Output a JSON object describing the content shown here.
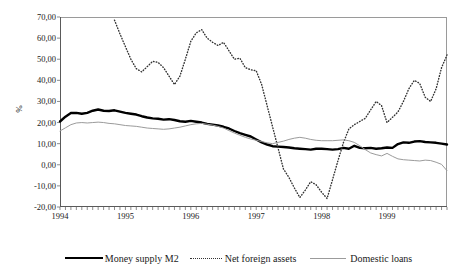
{
  "axis": {
    "ylabel": "%",
    "yticks": [
      "70,00",
      "60,00",
      "50,00",
      "40,00",
      "30,00",
      "20,00",
      "10,00",
      "0,00",
      "-10,00",
      "-20,00"
    ],
    "xticks": [
      "1994",
      "1995",
      "1996",
      "1997",
      "1998",
      "1999"
    ]
  },
  "legend": {
    "items": [
      {
        "label": "Money supply M2",
        "style": "solid-thick",
        "color": "#000000"
      },
      {
        "label": "Net foreign assets",
        "style": "dotted",
        "color": "#333333"
      },
      {
        "label": "Domestic loans",
        "style": "solid-thin",
        "color": "#9b9b9b"
      }
    ]
  },
  "chart_data": {
    "type": "line",
    "title": "",
    "xlabel": "",
    "ylabel": "%",
    "ylim": [
      -20,
      70
    ],
    "xlim": [
      "1994-01",
      "1999-12"
    ],
    "grid": false,
    "legend_position": "bottom",
    "x": [
      "1994-01",
      "1994-02",
      "1994-03",
      "1994-04",
      "1994-05",
      "1994-06",
      "1994-07",
      "1994-08",
      "1994-09",
      "1994-10",
      "1994-11",
      "1994-12",
      "1995-01",
      "1995-02",
      "1995-03",
      "1995-04",
      "1995-05",
      "1995-06",
      "1995-07",
      "1995-08",
      "1995-09",
      "1995-10",
      "1995-11",
      "1995-12",
      "1996-01",
      "1996-02",
      "1996-03",
      "1996-04",
      "1996-05",
      "1996-06",
      "1996-07",
      "1996-08",
      "1996-09",
      "1996-10",
      "1996-11",
      "1996-12",
      "1997-01",
      "1997-02",
      "1997-03",
      "1997-04",
      "1997-05",
      "1997-06",
      "1997-07",
      "1997-08",
      "1997-09",
      "1997-10",
      "1997-11",
      "1997-12",
      "1998-01",
      "1998-02",
      "1998-03",
      "1998-04",
      "1998-05",
      "1998-06",
      "1998-07",
      "1998-08",
      "1998-09",
      "1998-10",
      "1998-11",
      "1998-12",
      "1999-01",
      "1999-02",
      "1999-03",
      "1999-04",
      "1999-05",
      "1999-06",
      "1999-07",
      "1999-08",
      "1999-09",
      "1999-10",
      "1999-11",
      "1999-12"
    ],
    "series": [
      {
        "name": "Money supply M2",
        "style": "solid-thick",
        "color": "#000000",
        "values": [
          20.5,
          22.8,
          24.5,
          24.6,
          24.2,
          24.6,
          25.6,
          26.2,
          25.6,
          25.5,
          25.8,
          25.2,
          24.6,
          24.2,
          23.8,
          23.0,
          22.4,
          22.0,
          21.8,
          21.4,
          21.6,
          21.2,
          20.6,
          20.4,
          20.8,
          20.4,
          20.0,
          19.4,
          19.0,
          18.6,
          18.0,
          17.2,
          16.0,
          15.0,
          14.2,
          13.4,
          12.0,
          10.6,
          9.6,
          8.8,
          8.6,
          8.4,
          8.2,
          7.8,
          7.6,
          7.4,
          7.2,
          7.6,
          7.6,
          7.4,
          7.2,
          7.4,
          8.0,
          7.6,
          9.0,
          8.0,
          7.8,
          8.0,
          7.6,
          7.8,
          8.2,
          8.0,
          9.8,
          10.6,
          10.4,
          11.0,
          11.2,
          10.8,
          10.6,
          10.4,
          10.0,
          9.6
        ]
      },
      {
        "name": "Net foreign assets",
        "style": "dotted",
        "color": "#333333",
        "values": [
          null,
          null,
          null,
          null,
          null,
          null,
          null,
          null,
          null,
          null,
          68.5,
          62.0,
          56.0,
          50.0,
          45.5,
          44.0,
          46.5,
          49.0,
          48.5,
          46.0,
          42.0,
          38.0,
          42.0,
          50.0,
          58.5,
          62.5,
          64.0,
          60.0,
          58.0,
          56.5,
          58.0,
          54.0,
          50.0,
          50.5,
          46.0,
          45.0,
          44.5,
          38.0,
          28.0,
          18.0,
          8.0,
          -2.0,
          -6.0,
          -11.0,
          -15.5,
          -12.0,
          -8.0,
          -9.5,
          -13.0,
          -16.0,
          -7.0,
          2.0,
          10.5,
          17.0,
          19.0,
          20.5,
          22.0,
          26.0,
          30.0,
          28.0,
          20.0,
          22.5,
          25.0,
          30.0,
          36.0,
          40.0,
          38.5,
          32.0,
          30.0,
          36.0,
          46.0,
          52.0
        ]
      },
      {
        "name": "Domestic loans",
        "style": "solid-thin",
        "color": "#9b9b9b",
        "values": [
          16.0,
          17.5,
          19.0,
          19.8,
          20.0,
          19.8,
          20.0,
          20.2,
          20.0,
          19.6,
          19.4,
          19.0,
          18.6,
          18.4,
          18.2,
          17.8,
          17.4,
          17.2,
          17.0,
          16.8,
          17.0,
          17.4,
          17.8,
          18.4,
          19.0,
          19.4,
          19.6,
          19.2,
          18.8,
          18.2,
          17.4,
          16.2,
          15.0,
          14.0,
          13.0,
          12.2,
          11.6,
          11.0,
          10.4,
          10.0,
          10.6,
          11.2,
          12.0,
          12.6,
          13.0,
          12.6,
          12.0,
          11.6,
          11.4,
          11.4,
          11.4,
          11.6,
          11.8,
          11.4,
          10.6,
          9.0,
          7.2,
          5.6,
          4.8,
          4.2,
          5.4,
          4.0,
          2.8,
          2.4,
          2.2,
          2.0,
          1.8,
          2.2,
          2.0,
          1.2,
          0.2,
          -2.8
        ]
      }
    ]
  }
}
